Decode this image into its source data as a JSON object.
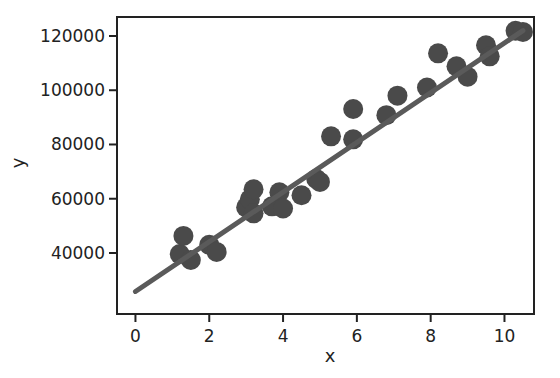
{
  "chart_data": {
    "type": "scatter",
    "title": "",
    "xlabel": "x",
    "ylabel": "y",
    "xlim": [
      -0.5,
      10.8
    ],
    "ylim": [
      17500,
      127000
    ],
    "xticks": [
      0,
      2,
      4,
      6,
      8,
      10
    ],
    "yticks": [
      40000,
      60000,
      80000,
      100000,
      120000
    ],
    "grid": false,
    "legend": null,
    "colors": {
      "points": "#4a4a4a",
      "line": "#5a5a5a",
      "axes": "#222222"
    },
    "series": [
      {
        "name": "data",
        "kind": "scatter",
        "x": [
          1.2,
          1.3,
          1.5,
          2.0,
          2.2,
          3.0,
          3.1,
          3.2,
          3.2,
          3.7,
          3.9,
          4.0,
          4.5,
          4.9,
          5.0,
          5.3,
          5.9,
          5.9,
          6.8,
          7.1,
          7.9,
          8.2,
          8.7,
          9.0,
          9.5,
          9.6,
          10.3,
          10.5
        ],
        "y": [
          39600,
          46300,
          37400,
          43000,
          40400,
          56800,
          59800,
          63500,
          54600,
          57200,
          62400,
          56400,
          61300,
          67300,
          66200,
          83000,
          93100,
          81900,
          90800,
          98000,
          101000,
          113600,
          108800,
          105000,
          116600,
          112500,
          121900,
          121500
        ]
      },
      {
        "name": "regression line",
        "kind": "line",
        "x": [
          0,
          10.5
        ],
        "y": [
          25800,
          122000
        ]
      }
    ]
  }
}
